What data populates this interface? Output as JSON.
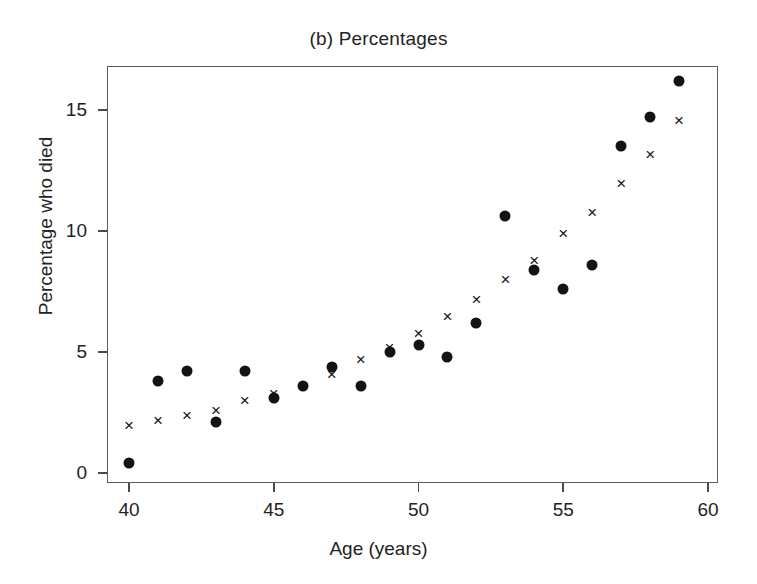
{
  "chart_data": {
    "type": "scatter",
    "title": "(b) Percentages",
    "xlabel": "Age (years)",
    "ylabel": "Percentage who died",
    "xlim": [
      39,
      60
    ],
    "ylim": [
      -0.2,
      16.8
    ],
    "xticks": [
      40,
      45,
      50,
      55,
      60
    ],
    "yticks": [
      0,
      5,
      10,
      15
    ],
    "xtick_labels": [
      "40",
      "45",
      "50",
      "55",
      "60"
    ],
    "ytick_labels": [
      "0",
      "5",
      "10",
      "15"
    ],
    "grid": false,
    "legend": "none",
    "x": [
      40,
      41,
      42,
      43,
      44,
      45,
      46,
      47,
      48,
      49,
      50,
      51,
      52,
      53,
      54,
      55,
      56,
      57,
      58,
      59
    ],
    "series": [
      {
        "name": "observed",
        "marker": "filled-circle",
        "values": [
          0.4,
          3.8,
          4.2,
          2.1,
          4.2,
          3.1,
          3.6,
          4.4,
          3.6,
          5.0,
          5.3,
          4.8,
          6.2,
          10.6,
          8.4,
          7.6,
          8.6,
          13.5,
          14.7,
          16.2
        ]
      },
      {
        "name": "fitted",
        "marker": "cross",
        "values": [
          2.0,
          2.2,
          2.4,
          2.6,
          3.0,
          3.3,
          3.6,
          4.1,
          4.7,
          5.2,
          5.8,
          6.5,
          7.2,
          8.0,
          8.8,
          9.9,
          10.8,
          12.0,
          13.2,
          14.6
        ]
      }
    ]
  }
}
